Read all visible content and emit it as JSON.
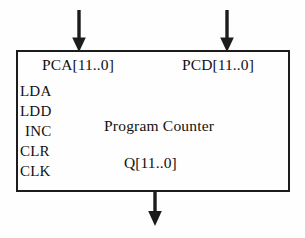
{
  "diagram": {
    "kind": "block-diagram",
    "title": "Program Counter",
    "block": {
      "label": "Program Counter"
    },
    "inputs_top": [
      {
        "name": "pca-bus",
        "label": "PCA[11..0]",
        "icon": "arrow-down-icon"
      },
      {
        "name": "pcd-bus",
        "label": "PCD[11..0]",
        "icon": "arrow-down-icon"
      }
    ],
    "inputs_left": [
      {
        "name": "lda",
        "label": "LDA"
      },
      {
        "name": "ldd",
        "label": "LDD"
      },
      {
        "name": "inc",
        "label": "INC"
      },
      {
        "name": "clr",
        "label": "CLR"
      },
      {
        "name": "clk",
        "label": "CLK"
      }
    ],
    "outputs_bottom": [
      {
        "name": "q-bus",
        "label": "Q[11..0]",
        "icon": "arrow-down-icon"
      }
    ],
    "colors": {
      "stroke": "#1c1c1c",
      "text": "#111111",
      "background": "#fefefe"
    }
  }
}
